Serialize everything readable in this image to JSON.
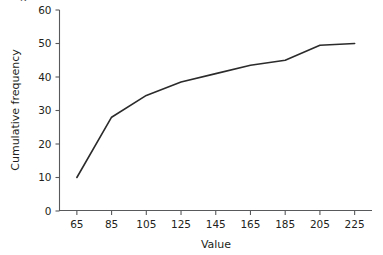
{
  "figure": {
    "clipped_top_mark": "g"
  },
  "chart_data": {
    "type": "line",
    "title": "",
    "subtitle": "",
    "xlabel": "Value",
    "ylabel": "Cumulative frequency",
    "x": [
      65,
      85,
      105,
      125,
      145,
      165,
      185,
      205,
      225
    ],
    "values": [
      10,
      28,
      34.5,
      38.5,
      41,
      43.5,
      45,
      49.5,
      50
    ],
    "series": [
      {
        "name": "Cumulative frequency",
        "values": [
          10,
          28,
          34.5,
          38.5,
          41,
          43.5,
          45,
          49.5,
          50
        ]
      }
    ],
    "xticks": [
      65,
      85,
      105,
      125,
      145,
      165,
      185,
      205,
      225
    ],
    "xtick_labels": [
      "65",
      "85",
      "105",
      "125",
      "145",
      "165",
      "185",
      "205",
      "225"
    ],
    "yticks": [
      0,
      10,
      20,
      30,
      40,
      50,
      60
    ],
    "ytick_labels": [
      "0",
      "10",
      "20",
      "30",
      "40",
      "50",
      "60"
    ],
    "xlim": [
      55,
      235
    ],
    "ylim": [
      0,
      60
    ],
    "grid": false,
    "legend": false,
    "legend_position": "none",
    "line_color": "#2b2b2b",
    "axis_color": "#58595b"
  }
}
